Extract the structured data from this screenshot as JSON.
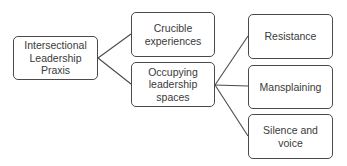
{
  "diagram": {
    "type": "tree",
    "colors": {
      "border": "#4a4a4a",
      "text": "#3a3a3a",
      "background": "#ffffff",
      "line": "#4a4a4a"
    },
    "root": {
      "label": "Intersectional\nLeadership Praxis"
    },
    "level1": [
      {
        "label": "Crucible\nexperiences"
      },
      {
        "label": "Occupying\nleadership\nspaces"
      }
    ],
    "level2": [
      {
        "label": "Resistance"
      },
      {
        "label": "Mansplaining"
      },
      {
        "label": "Silence and voice"
      }
    ],
    "edges": [
      {
        "from": "Intersectional Leadership Praxis",
        "to": "Crucible experiences"
      },
      {
        "from": "Intersectional Leadership Praxis",
        "to": "Occupying leadership spaces"
      },
      {
        "from": "Occupying leadership spaces",
        "to": "Resistance"
      },
      {
        "from": "Occupying leadership spaces",
        "to": "Mansplaining"
      },
      {
        "from": "Occupying leadership spaces",
        "to": "Silence and voice"
      }
    ]
  }
}
